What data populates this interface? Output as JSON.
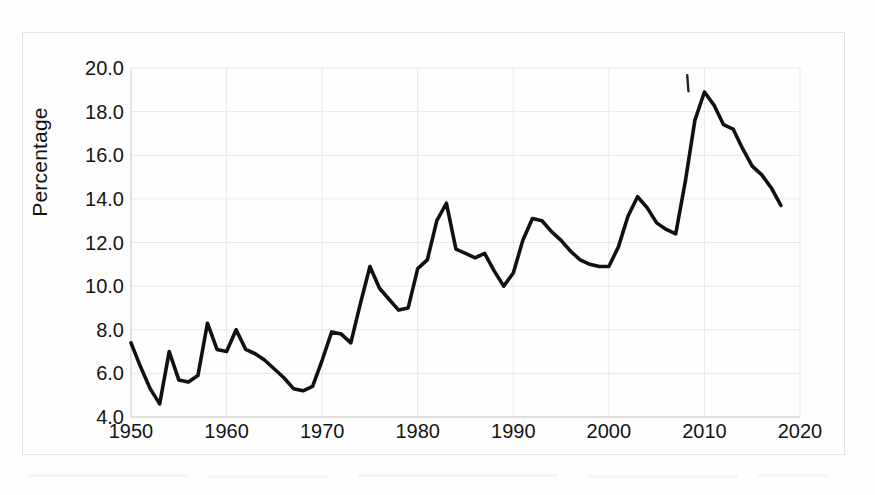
{
  "figure": {
    "background_color": "#fefefe",
    "line_color": "#111111",
    "grid_color": "#e8e8e8",
    "axis_color": "#d8d8d8"
  },
  "axes": {
    "y_title": "Percentage",
    "y_ticks": [
      "20.0",
      "18.0",
      "16.0",
      "14.0",
      "12.0",
      "10.0",
      "8.0",
      "6.0",
      "4.0"
    ],
    "x_ticks": [
      "1950",
      "1960",
      "1970",
      "1980",
      "1990",
      "2000",
      "2010",
      "2020"
    ]
  },
  "annotation": {
    "tick_mark_label": "|"
  },
  "chart_data": {
    "type": "line",
    "title": "",
    "xlabel": "",
    "ylabel": "Percentage",
    "xlim": [
      1950,
      2020
    ],
    "ylim": [
      4.0,
      20.0
    ],
    "ytick_values": [
      4.0,
      6.0,
      8.0,
      10.0,
      12.0,
      14.0,
      16.0,
      18.0,
      20.0
    ],
    "xtick_values": [
      1950,
      1960,
      1970,
      1980,
      1990,
      2000,
      2010,
      2020
    ],
    "grid": true,
    "legend": "none",
    "series": [
      {
        "name": "Percentage",
        "color": "#111111",
        "x": [
          1950,
          1951,
          1952,
          1953,
          1954,
          1955,
          1956,
          1957,
          1958,
          1959,
          1960,
          1961,
          1962,
          1963,
          1964,
          1965,
          1966,
          1967,
          1968,
          1969,
          1970,
          1971,
          1972,
          1973,
          1974,
          1975,
          1976,
          1977,
          1978,
          1979,
          1980,
          1981,
          1982,
          1983,
          1984,
          1985,
          1986,
          1987,
          1988,
          1989,
          1990,
          1991,
          1992,
          1993,
          1994,
          1995,
          1996,
          1997,
          1998,
          1999,
          2000,
          2001,
          2002,
          2003,
          2004,
          2005,
          2006,
          2007,
          2008,
          2009,
          2010,
          2011,
          2012,
          2013,
          2014,
          2015,
          2016,
          2017,
          2018
        ],
        "values": [
          7.4,
          6.3,
          5.3,
          4.6,
          7.0,
          5.7,
          5.6,
          5.9,
          8.3,
          7.1,
          7.0,
          8.0,
          7.1,
          6.9,
          6.6,
          6.2,
          5.8,
          5.3,
          5.2,
          5.4,
          6.6,
          7.9,
          7.8,
          7.4,
          9.2,
          10.9,
          9.9,
          9.4,
          8.9,
          9.0,
          10.8,
          11.2,
          13.0,
          13.8,
          11.7,
          11.5,
          11.3,
          11.5,
          10.7,
          10.0,
          10.6,
          12.1,
          13.1,
          13.0,
          12.5,
          12.1,
          11.6,
          11.2,
          11.0,
          10.9,
          10.9,
          11.8,
          13.2,
          14.1,
          13.6,
          12.9,
          12.6,
          12.4,
          14.8,
          17.6,
          18.9,
          18.3,
          17.4,
          17.2,
          16.3,
          15.5,
          15.1,
          14.5,
          13.7
        ]
      }
    ],
    "annotations": [
      {
        "type": "tick-mark",
        "x": 2008.2,
        "y": 19.3,
        "label": "|"
      }
    ]
  }
}
